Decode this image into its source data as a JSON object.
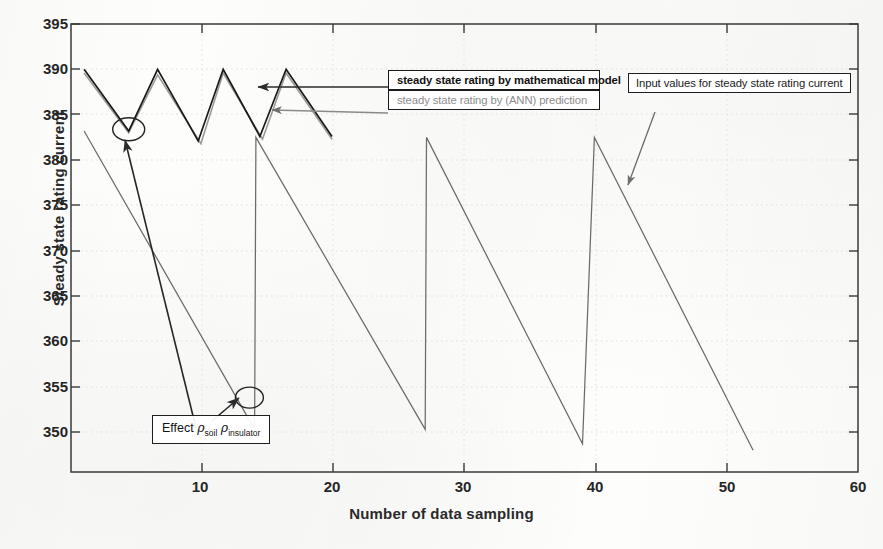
{
  "chart_data": {
    "type": "line",
    "title": "",
    "xlabel": "Number of data sampling",
    "ylabel": "Steady state rating current",
    "xlim": [
      0,
      60
    ],
    "ylim": [
      345.6,
      395
    ],
    "xticks": [
      10,
      20,
      30,
      40,
      50,
      60
    ],
    "yticks": [
      350,
      355,
      360,
      365,
      370,
      375,
      380,
      385,
      390,
      395
    ],
    "grid": true,
    "legend_position": "upper-right-inside",
    "series": [
      {
        "name": "steady state rating by mathematical model",
        "color": "#1a1a1a",
        "points": [
          [
            1.0,
            390.0
          ],
          [
            4.4,
            383.2
          ],
          [
            6.6,
            390.0
          ],
          [
            9.7,
            382.1
          ],
          [
            11.6,
            390.0
          ],
          [
            14.4,
            382.6
          ],
          [
            16.4,
            390.0
          ],
          [
            19.9,
            382.6
          ]
        ]
      },
      {
        "name": "steady state rating by (ANN) prediction",
        "color": "#9a9a9a",
        "points": [
          [
            1.0,
            389.6
          ],
          [
            4.4,
            383.0
          ],
          [
            6.6,
            389.4
          ],
          [
            9.9,
            381.8
          ],
          [
            11.6,
            389.6
          ],
          [
            14.6,
            382.3
          ],
          [
            16.4,
            389.6
          ],
          [
            19.9,
            382.3
          ]
        ]
      },
      {
        "name": "Input values for steady state rating current",
        "color": "#6b6b6b",
        "points": [
          [
            1.0,
            383.2
          ],
          [
            14.0,
            350.3
          ],
          [
            14.1,
            382.5
          ],
          [
            27.0,
            350.3
          ],
          [
            27.1,
            382.5
          ],
          [
            39.0,
            348.7
          ],
          [
            39.9,
            382.5
          ],
          [
            52.0,
            348.0
          ]
        ]
      }
    ],
    "annotations": [
      {
        "name": "legend-model",
        "text": "steady state rating by mathematical model"
      },
      {
        "name": "legend-ann",
        "text": "steady state rating by (ANN) prediction"
      },
      {
        "name": "input-callout",
        "text": "Input values for steady state rating current"
      },
      {
        "name": "effect-callout",
        "text": "Effect ρsoil ρinsulator",
        "parts": {
          "lead": "Effect",
          "rho": "ρ",
          "sub1": "soil",
          "sub2": "insulator"
        }
      }
    ],
    "markers": [
      {
        "name": "circle-marker-upper",
        "x": 4.4,
        "y": 383.4
      },
      {
        "name": "circle-marker-lower",
        "x": 13.6,
        "y": 353.8
      }
    ]
  },
  "axes": {
    "ylabel": "Steady state rating current",
    "xlabel": "Number of data sampling",
    "ytick_labels": [
      "395",
      "390",
      "385",
      "380",
      "375",
      "370",
      "365",
      "360",
      "355",
      "350"
    ],
    "xtick_labels": [
      "10",
      "20",
      "30",
      "40",
      "50",
      "60"
    ]
  },
  "legend": {
    "model": "steady state rating by mathematical model",
    "ann": "steady state rating by (ANN) prediction"
  },
  "callouts": {
    "input": "Input values for steady state rating current",
    "effect_lead": "Effect",
    "effect_rho": "ρ",
    "effect_sub1": "soil",
    "effect_sub2": "insulator"
  },
  "colors": {
    "model": "#1a1a1a",
    "ann": "#9a9a9a",
    "input": "#6b6b6b",
    "axis": "#333333",
    "grid": "#d9d9d9"
  }
}
